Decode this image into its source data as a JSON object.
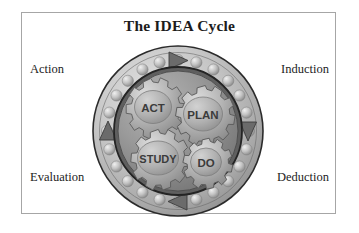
{
  "figure": {
    "title": "The IDEA Cycle",
    "background_color": "#ffffff",
    "frame_color": "#a6a6a6"
  },
  "corner_labels": {
    "top_left": "Action",
    "top_right": "Induction",
    "bottom_left": "Evaluation",
    "bottom_right": "Deduction"
  },
  "wheel": {
    "outer_ring_color": "#b9b9b9",
    "inner_hub_color": "#8c8c8c",
    "bolt_count": 24,
    "arrow_color": "#6e6e6e",
    "arrows": [
      {
        "position": "top",
        "direction": "right"
      },
      {
        "position": "right",
        "direction": "down"
      },
      {
        "position": "bottom",
        "direction": "left"
      },
      {
        "position": "left",
        "direction": "up"
      }
    ]
  },
  "gears": [
    {
      "label": "ACT",
      "position": "top-left"
    },
    {
      "label": "PLAN",
      "position": "top-right"
    },
    {
      "label": "STUDY",
      "position": "bottom-left"
    },
    {
      "label": "DO",
      "position": "bottom-right"
    }
  ]
}
